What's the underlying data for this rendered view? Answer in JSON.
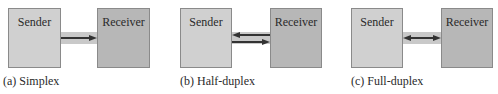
{
  "panels": [
    {
      "sender": "Sender",
      "receiver": "Receiver",
      "caption": "(a) Simplex",
      "mode": "simplex"
    },
    {
      "sender": "Sender",
      "receiver": "Receiver",
      "caption": "(b) Half-duplex",
      "mode": "half-duplex"
    },
    {
      "sender": "Sender",
      "receiver": "Receiver",
      "caption": "(c) Full-duplex",
      "mode": "full-duplex"
    }
  ],
  "colors": {
    "sender_fill": "#d0d0d0",
    "receiver_fill": "#b7b7b7",
    "band": "#c9c9c9",
    "arrow": "#333333"
  }
}
